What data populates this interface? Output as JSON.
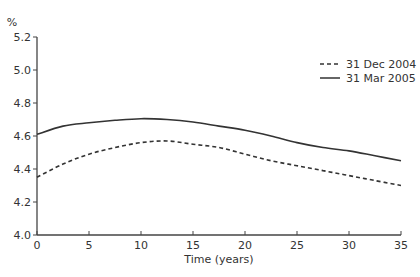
{
  "chart_data": {
    "type": "line",
    "title": "",
    "xlabel": "Time (years)",
    "ylabel": "%",
    "xlim": [
      0,
      35
    ],
    "ylim": [
      4.0,
      5.2
    ],
    "x_ticks": [
      "0",
      "5",
      "10",
      "15",
      "20",
      "25",
      "30",
      "35"
    ],
    "y_ticks": [
      "4.0",
      "4.2",
      "4.4",
      "4.6",
      "4.8",
      "5.0",
      "5.2"
    ],
    "grid": false,
    "legend_position": "upper right",
    "x": [
      0,
      2.5,
      5,
      7.5,
      10,
      12.5,
      15,
      17.5,
      20,
      22.5,
      25,
      27.5,
      30,
      32.5,
      35
    ],
    "series": [
      {
        "name": "31 Dec 2004",
        "style": "dashed",
        "values": [
          4.35,
          4.43,
          4.49,
          4.53,
          4.56,
          4.57,
          4.55,
          4.53,
          4.49,
          4.45,
          4.42,
          4.39,
          4.36,
          4.33,
          4.3
        ]
      },
      {
        "name": "31 Mar 2005",
        "style": "solid",
        "values": [
          4.61,
          4.66,
          4.68,
          4.695,
          4.705,
          4.7,
          4.685,
          4.66,
          4.635,
          4.6,
          4.56,
          4.53,
          4.51,
          4.48,
          4.45
        ]
      }
    ]
  }
}
